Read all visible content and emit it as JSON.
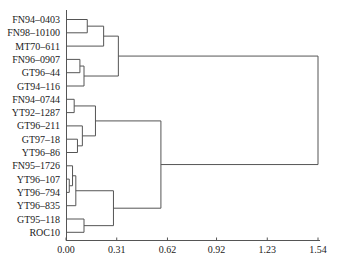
{
  "chart_data": {
    "type": "dendrogram",
    "title": "",
    "xlabel": "",
    "ylabel": "",
    "x_axis": {
      "ticks": [
        0.0,
        0.31,
        0.62,
        0.92,
        1.23,
        1.54
      ],
      "tick_labels": [
        "0.00",
        "0.31",
        "0.62",
        "0.92",
        "1.23",
        "1.54"
      ],
      "range": [
        0,
        1.54
      ]
    },
    "leaves": [
      "FN94-0403",
      "FN98-10100",
      "MT70-611",
      "FN96-0907",
      "GT96-44",
      "GT94-116",
      "FN94-0744",
      "YT92-1287",
      "GT96-211",
      "GT97-18",
      "YT96-86",
      "FN95-1726",
      "YT96-107",
      "YT96-794",
      "YT96-835",
      "GT95-118",
      "ROC10"
    ],
    "merges": [
      {
        "id": "c1",
        "children": [
          "FN94-0403",
          "FN98-10100"
        ],
        "height": 0.13
      },
      {
        "id": "c2",
        "children": [
          "c1",
          "MT70-611"
        ],
        "height": 0.23
      },
      {
        "id": "c3",
        "children": [
          "FN96-0907",
          "GT96-44"
        ],
        "height": 0.085
      },
      {
        "id": "c4",
        "children": [
          "c3",
          "GT94-116"
        ],
        "height": 0.11
      },
      {
        "id": "c5",
        "children": [
          "c2",
          "c4"
        ],
        "height": 0.32
      },
      {
        "id": "c6",
        "children": [
          "FN94-0744",
          "YT92-1287"
        ],
        "height": 0.05
      },
      {
        "id": "c7",
        "children": [
          "GT97-18",
          "YT96-86"
        ],
        "height": 0.07
      },
      {
        "id": "c8",
        "children": [
          "GT96-211",
          "c7"
        ],
        "height": 0.1
      },
      {
        "id": "c9",
        "children": [
          "c6",
          "c8"
        ],
        "height": 0.18
      },
      {
        "id": "c10",
        "children": [
          "YT96-107",
          "YT96-794"
        ],
        "height": 0.02
      },
      {
        "id": "c11",
        "children": [
          "FN95-1726",
          "c10"
        ],
        "height": 0.04
      },
      {
        "id": "c12",
        "children": [
          "c11",
          "YT96-835"
        ],
        "height": 0.06
      },
      {
        "id": "c13",
        "children": [
          "GT95-118",
          "ROC10"
        ],
        "height": 0.11
      },
      {
        "id": "c14",
        "children": [
          "c12",
          "c13"
        ],
        "height": 0.29
      },
      {
        "id": "c15",
        "children": [
          "c9",
          "c14"
        ],
        "height": 0.58
      },
      {
        "id": "c16",
        "children": [
          "c5",
          "c15"
        ],
        "height": 1.54
      }
    ],
    "grid": false,
    "legend": null
  }
}
